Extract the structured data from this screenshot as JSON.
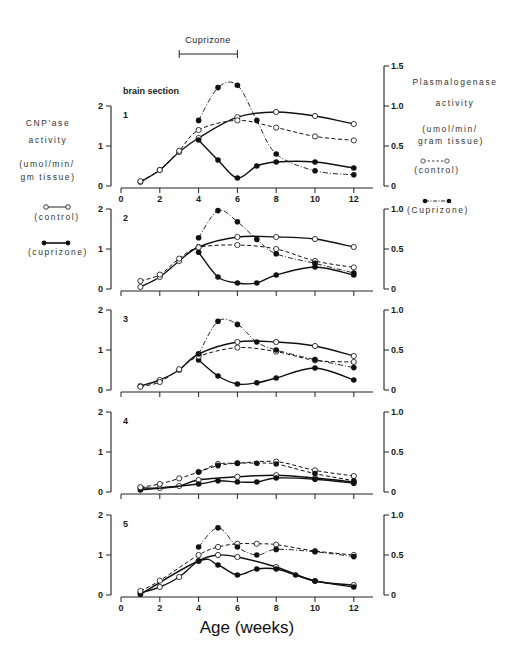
{
  "chart_data": {
    "type": "line",
    "title": "",
    "xlabel": "Age (weeks)",
    "x_ticks": [
      0,
      2,
      4,
      6,
      8,
      10,
      12
    ],
    "xlim": [
      0,
      13
    ],
    "treatment_bar": {
      "label": "Cuprizone",
      "start_week": 3,
      "end_week": 6
    },
    "panel_header": "brain section",
    "left_axis": {
      "label_lines": [
        "CNP'ase",
        "activity",
        "(umol/min/",
        "gm tissue)"
      ],
      "legend": [
        {
          "label": "(control)",
          "marker": "open-circle",
          "line": "solid"
        },
        {
          "label": "(cuprizone)",
          "marker": "filled-circle",
          "line": "solid"
        }
      ]
    },
    "right_axis": {
      "label_lines": [
        "Plasmalogenase",
        "activity",
        "(umol/min/",
        "gram tissue)"
      ],
      "legend": [
        {
          "label": "(control)",
          "marker": "open-circle",
          "line": "dashed"
        },
        {
          "label": "(Cuprizone)",
          "marker": "filled-circle",
          "line": "dash-dot"
        }
      ]
    },
    "panels": [
      {
        "label": "1",
        "left_ylim": [
          0,
          2
        ],
        "left_ticks": [
          "0",
          "1",
          "2"
        ],
        "right_ylim": [
          0,
          1.5
        ],
        "right_ticks": [
          "0",
          "0.5",
          "1.0",
          "1.5"
        ],
        "series": [
          {
            "name": "CNPase control",
            "axis": "left",
            "style": "solid",
            "marker": "open",
            "x": [
              1,
              2,
              3,
              4,
              6,
              8,
              10,
              12
            ],
            "y": [
              0.1,
              0.4,
              0.85,
              1.2,
              1.72,
              1.85,
              1.75,
              1.55
            ]
          },
          {
            "name": "CNPase cuprizone",
            "axis": "left",
            "style": "solid",
            "marker": "filled",
            "x": [
              4,
              5,
              6,
              7,
              8,
              10,
              12
            ],
            "y": [
              1.15,
              0.65,
              0.2,
              0.5,
              0.6,
              0.6,
              0.45
            ]
          },
          {
            "name": "Plasmalogenase control",
            "axis": "right",
            "style": "dashed",
            "marker": "open",
            "x": [
              1,
              2,
              3,
              4,
              6,
              8,
              10,
              12
            ],
            "y": [
              0.06,
              0.2,
              0.44,
              0.7,
              0.82,
              0.73,
              0.62,
              0.57
            ]
          },
          {
            "name": "Plasmalogenase cuprizone",
            "axis": "right",
            "style": "dashdot",
            "marker": "filled",
            "x": [
              4,
              5,
              6,
              7,
              8,
              10,
              12
            ],
            "y": [
              0.82,
              1.23,
              1.26,
              0.82,
              0.4,
              0.19,
              0.14
            ]
          }
        ]
      },
      {
        "label": "2",
        "left_ylim": [
          0,
          2
        ],
        "left_ticks": [
          "0",
          "1",
          "2"
        ],
        "right_ylim": [
          0,
          1.0
        ],
        "right_ticks": [
          "0",
          "0.5",
          "1.0"
        ],
        "series": [
          {
            "name": "CNPase control",
            "axis": "left",
            "style": "solid",
            "marker": "open",
            "x": [
              1,
              2,
              3,
              4,
              6,
              8,
              10,
              12
            ],
            "y": [
              0.05,
              0.3,
              0.7,
              1.05,
              1.3,
              1.3,
              1.25,
              1.05
            ]
          },
          {
            "name": "CNPase cuprizone",
            "axis": "left",
            "style": "solid",
            "marker": "filled",
            "x": [
              4,
              5,
              6,
              7,
              8,
              10,
              12
            ],
            "y": [
              0.92,
              0.3,
              0.15,
              0.15,
              0.35,
              0.55,
              0.35
            ]
          },
          {
            "name": "Plasmalogenase control",
            "axis": "right",
            "style": "dashed",
            "marker": "open",
            "x": [
              1,
              2,
              3,
              4,
              6,
              8,
              10,
              12
            ],
            "y": [
              0.1,
              0.18,
              0.38,
              0.52,
              0.55,
              0.5,
              0.35,
              0.27
            ]
          },
          {
            "name": "Plasmalogenase cuprizone",
            "axis": "right",
            "style": "dashdot",
            "marker": "filled",
            "x": [
              4,
              5,
              6,
              7,
              8,
              10,
              12
            ],
            "y": [
              0.64,
              0.98,
              0.84,
              0.62,
              0.44,
              0.32,
              0.2
            ]
          }
        ]
      },
      {
        "label": "3",
        "left_ylim": [
          0,
          2
        ],
        "left_ticks": [
          "0",
          "1",
          "2"
        ],
        "right_ylim": [
          0,
          1.0
        ],
        "right_ticks": [
          "0",
          "0.5",
          "1.0"
        ],
        "series": [
          {
            "name": "CNPase control",
            "axis": "left",
            "style": "solid",
            "marker": "open",
            "x": [
              1,
              2,
              3,
              4,
              6,
              8,
              10,
              12
            ],
            "y": [
              0.1,
              0.25,
              0.5,
              0.9,
              1.2,
              1.2,
              1.1,
              0.85
            ]
          },
          {
            "name": "CNPase cuprizone",
            "axis": "left",
            "style": "solid",
            "marker": "filled",
            "x": [
              4,
              5,
              6,
              7,
              8,
              10,
              12
            ],
            "y": [
              0.75,
              0.35,
              0.15,
              0.18,
              0.3,
              0.55,
              0.25
            ]
          },
          {
            "name": "Plasmalogenase control",
            "axis": "right",
            "style": "dashed",
            "marker": "open",
            "x": [
              1,
              2,
              3,
              4,
              6,
              8,
              10,
              12
            ],
            "y": [
              0.04,
              0.1,
              0.26,
              0.42,
              0.53,
              0.48,
              0.37,
              0.35
            ]
          },
          {
            "name": "Plasmalogenase cuprizone",
            "axis": "right",
            "style": "dashdot",
            "marker": "filled",
            "x": [
              4,
              5,
              6,
              7,
              8,
              10,
              12
            ],
            "y": [
              0.45,
              0.86,
              0.82,
              0.6,
              0.5,
              0.38,
              0.28
            ]
          }
        ]
      },
      {
        "label": "4",
        "left_ylim": [
          0,
          2
        ],
        "left_ticks": [
          "0",
          "1",
          "2"
        ],
        "right_ylim": [
          0,
          1.0
        ],
        "right_ticks": [
          "0",
          "0.5",
          "1.0"
        ],
        "series": [
          {
            "name": "CNPase control",
            "axis": "left",
            "style": "solid",
            "marker": "open",
            "x": [
              1,
              2,
              3,
              4,
              6,
              8,
              10,
              12
            ],
            "y": [
              0.1,
              0.1,
              0.15,
              0.3,
              0.38,
              0.42,
              0.35,
              0.25
            ]
          },
          {
            "name": "CNPase cuprizone",
            "axis": "left",
            "style": "solid",
            "marker": "filled",
            "x": [
              1,
              4,
              5,
              6,
              7,
              8,
              10,
              12
            ],
            "y": [
              0.05,
              0.2,
              0.28,
              0.25,
              0.25,
              0.35,
              0.32,
              0.22
            ]
          },
          {
            "name": "Plasmalogenase control",
            "axis": "right",
            "style": "dashed",
            "marker": "open",
            "x": [
              1,
              2,
              3,
              4,
              5,
              6,
              8,
              10,
              12
            ],
            "y": [
              0.06,
              0.1,
              0.17,
              0.25,
              0.35,
              0.36,
              0.38,
              0.27,
              0.2
            ]
          },
          {
            "name": "Plasmalogenase cuprizone",
            "axis": "right",
            "style": "dashed",
            "marker": "filled",
            "x": [
              4,
              5,
              6,
              7,
              8,
              10,
              12
            ],
            "y": [
              0.25,
              0.33,
              0.36,
              0.36,
              0.35,
              0.23,
              0.14
            ]
          }
        ]
      },
      {
        "label": "5",
        "left_ylim": [
          0,
          2
        ],
        "left_ticks": [
          "0",
          "1",
          "2"
        ],
        "right_ylim": [
          0,
          1.0
        ],
        "right_ticks": [
          "0",
          "0.5",
          "1.0"
        ],
        "series": [
          {
            "name": "CNPase control",
            "axis": "left",
            "style": "solid",
            "marker": "open",
            "x": [
              1,
              2,
              3,
              4,
              5,
              6,
              8,
              10,
              12
            ],
            "y": [
              0.05,
              0.2,
              0.45,
              0.85,
              1.0,
              0.95,
              0.7,
              0.35,
              0.25
            ]
          },
          {
            "name": "CNPase cuprizone",
            "axis": "left",
            "style": "solid",
            "marker": "filled",
            "x": [
              1,
              4,
              5,
              6,
              7,
              8,
              9,
              10,
              12
            ],
            "y": [
              0.02,
              0.85,
              0.75,
              0.5,
              0.65,
              0.65,
              0.5,
              0.35,
              0.2
            ]
          },
          {
            "name": "Plasmalogenase control",
            "axis": "right",
            "style": "dashed",
            "marker": "open",
            "x": [
              1,
              2,
              4,
              5,
              6,
              7,
              8,
              10,
              12
            ],
            "y": [
              0.05,
              0.18,
              0.5,
              0.6,
              0.64,
              0.64,
              0.63,
              0.55,
              0.5
            ]
          },
          {
            "name": "Plasmalogenase cuprizone",
            "axis": "right",
            "style": "dashdot",
            "marker": "filled",
            "x": [
              4,
              5,
              6,
              7,
              8,
              10,
              12
            ],
            "y": [
              0.6,
              0.84,
              0.6,
              0.5,
              0.57,
              0.54,
              0.48
            ]
          }
        ]
      }
    ]
  }
}
